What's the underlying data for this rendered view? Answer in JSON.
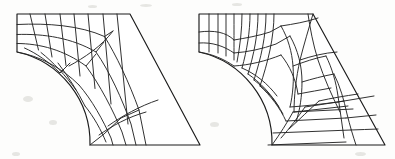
{
  "figure": {
    "background_color": "#fdfdfc",
    "line_color": "#1b1b1b",
    "fill_color": "#ffffff",
    "width": 395,
    "height": 159,
    "panel_count": 2
  },
  "panels": [
    {
      "id": "mesh-left",
      "label": "Structured mapped quadrilateral mesh",
      "origin_x": 0,
      "mesh_type": "structured",
      "rows": 7,
      "columns": 8,
      "boundary": {
        "description": "Top horizontal edge, short left edge, concave circular arc, horizontal bottom edge, straight slanted right edge",
        "top_left": [
          17,
          14
        ],
        "top_right": [
          130,
          14
        ],
        "bottom_right": [
          200,
          145
        ],
        "bottom_left_arc_end": [
          90,
          145
        ],
        "left_edge_bottom": [
          17,
          52
        ],
        "arc_radius": 93,
        "arc_center": [
          110,
          52
        ]
      },
      "path": "M17,14 L130,14 L200,145 L90,145 A93,93 0 0,0 17,52 Z",
      "grid_lines": [
        "M17,24.5 C48,23 80,25.5 104.5,36.5 L113,31",
        "M17,34.5 C44,33.5 72,38 96,52 L104,42",
        "M17,43.5 C40,43.5 64,50 86,66 L96,54",
        "M24.5,48 C36,53 49,62 60,73 L70,63",
        "M17,52 C40,56 62,68 79,85",
        "M41,52.5 C53,62 66,76 76,90",
        "M58,63 C68,76 78,92 85,106",
        "M30,14 L38.5,50",
        "M45,14 L52,57",
        "M60,14 L66,65.5",
        "M74,14 L80,76",
        "M88,14 L95,88.5",
        "M103,14 L111,104",
        "M117,14 L128,124",
        "M104.5,36.5 C116,55 129,82 139,110 L146,145",
        "M96,52 C110,72 122,99 131,124 L136,145",
        "M86,66 C100,85 113,110 122,132 L126,145",
        "M79,85 C92,100 103,120 111,138 L113,145",
        "M85,106 C94,117 101,130 106,142",
        "M90,145 L104,134 L121,118 L139,110",
        "M99,135 C112,126 128,117 146,112",
        "M108,126 C122,116 140,106 158,100",
        "M69,66 C84,58 102,46 113,31"
      ]
    },
    {
      "id": "mesh-right",
      "label": "Unstructured adaptive quadrilateral mesh",
      "origin_x": 182,
      "mesh_type": "unstructured",
      "boundary": {
        "description": "Same outline as left panel: top horizontal edge, short left edge, concave circular arc, horizontal bottom edge, straight slanted right edge",
        "top_left": [
          199,
          14
        ],
        "top_right": [
          313,
          14
        ],
        "bottom_right": [
          385,
          145
        ],
        "bottom_left_arc_end": [
          272,
          145
        ],
        "left_edge_bottom": [
          199,
          52
        ],
        "arc_radius": 93,
        "arc_center": [
          292,
          52
        ]
      },
      "path": "M17,14 L131,14 L203,145 L90,145 A93,93 0 0,0 17,52 Z",
      "grid_lines": [
        "M17,32 C32,30 44,32 52,40",
        "M17,43 C30,42 42,46 52,53",
        "M17,52 C30,54 42,59 52,66",
        "M27,14 L27,52",
        "M36,14 L36,53",
        "M44,14 L44,56",
        "M52,14 C52,28 52,42 52,60",
        "M60,14 C60,30 58,46 55,62",
        "M68,14 C68,32 65,50 60,68",
        "M76,14 C76,34 72,54 66,74",
        "M84,14 C84,36 79,58 72,80",
        "M92,14 C92,38 86,62 78,86",
        "M52,40 C64,38 76,36 88,32 L99,26",
        "M52,53 C66,52 80,49 94,44 L108,36",
        "M52,66 C68,65 84,61 99,55",
        "M60,68 C74,74 86,84 95,96",
        "M66,74 C78,82 89,94 97,107",
        "M72,80 C84,89 94,101 101,114",
        "M78,86 C89,96 98,108 104,121",
        "M90,145 C98,134 105,123 111,112",
        "M99,138 C108,128 116,117 123,107",
        "M107,129 C118,119 128,109 137,101",
        "M99,26 C106,38 110,52 111,66 C112,80 111,94 108,107",
        "M108,36 C116,50 120,66 120,82 C120,96 118,110 114,122",
        "M99,55 C108,66 114,80 116,94",
        "M131,14 C127,28 122,44 118,60 C114,78 112,96 112,112",
        "M111,66 C122,62 133,58 144,56",
        "M120,82 C130,79 141,76 152,74",
        "M116,94 C127,92 138,90 149,88",
        "M108,107 C124,106 140,104 156,102",
        "M104,121 C124,120 144,119 164,118",
        "M111,112 C131,111 151,110 171,109",
        "M91,133 C117,132 143,131 169,130",
        "M86,145 C112,144 138,143 164,142",
        "M144,56 C150,68 154,82 156,96 C158,110 160,124 162,138",
        "M152,74 C158,86 162,100 165,114 C168,126 171,136 174,145",
        "M126,14 C128,28 131,44 136,60 C142,78 150,96 158,112",
        "M118,60 C130,56 142,53 155,52",
        "M112,112 C130,110 148,108 166,106",
        "M137,101 C150,98 163,96 176,94",
        "M123,107 C136,105 149,103 162,101",
        "M164,118 C174,117 184,116 194,115",
        "M169,130 C178,130 187,129 196,129",
        "M156,102 C168,100 180,98 192,96",
        "M99,26 C112,24 124,22 136,18"
      ]
    }
  ],
  "specks": [
    {
      "x": 88,
      "y": 5,
      "w": 9,
      "h": 3
    },
    {
      "x": 140,
      "y": 4,
      "w": 12,
      "h": 3
    },
    {
      "x": 232,
      "y": 3,
      "w": 10,
      "h": 3
    },
    {
      "x": 23,
      "y": 96,
      "w": 10,
      "h": 6
    },
    {
      "x": 49,
      "y": 120,
      "w": 8,
      "h": 5
    },
    {
      "x": 210,
      "y": 122,
      "w": 9,
      "h": 5
    },
    {
      "x": 355,
      "y": 152,
      "w": 11,
      "h": 4
    },
    {
      "x": 12,
      "y": 152,
      "w": 8,
      "h": 4
    }
  ]
}
